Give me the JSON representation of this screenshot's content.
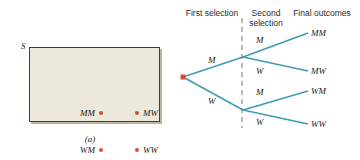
{
  "figure": {
    "panel_a": {
      "caption": "(a)",
      "sample_space_label": "S",
      "outcomes": [
        {
          "label": "MM",
          "dot_side": "right"
        },
        {
          "label": "MW",
          "dot_side": "left"
        },
        {
          "label": "WM",
          "dot_side": "right"
        },
        {
          "label": "WW",
          "dot_side": "left"
        }
      ],
      "colors": {
        "region_fill": "#ece8dc",
        "region_border": "#3d3d3d",
        "dot": "#d94f2b"
      }
    },
    "panel_b": {
      "caption": "(b)",
      "column_headers": [
        "First\nselection",
        "Second\nselection",
        "Final\noutcomes"
      ],
      "headers": {
        "first": "First selection",
        "second": "Second selection",
        "final": "Final outcomes"
      },
      "branch_labels": {
        "first_upper": "M",
        "first_lower": "W",
        "second_upper_upper": "M",
        "second_upper_lower": "W",
        "second_lower_upper": "M",
        "second_lower_lower": "W"
      },
      "final_outcomes": [
        "MM",
        "MW",
        "WM",
        "WW"
      ],
      "colors": {
        "branch": "#3d9cb0",
        "root_dot": "#d94f2b",
        "divider": "#8a8a8a"
      }
    }
  }
}
